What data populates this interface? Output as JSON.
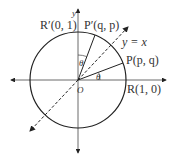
{
  "diagram": {
    "type": "unit-circle reflection",
    "axes": {
      "x_label": "x",
      "y_label": "y"
    },
    "line_label": "y = x",
    "points": [
      {
        "name": "R",
        "label": "R(1, 0)"
      },
      {
        "name": "R'",
        "label": "R′(0, 1)"
      },
      {
        "name": "P",
        "label": "P(p, q)"
      },
      {
        "name": "P'",
        "label": "P′(q, p)"
      },
      {
        "name": "O",
        "label": "O"
      }
    ],
    "angle_label": "θ",
    "colors": {
      "stroke": "#222222",
      "text": "#333333",
      "background": "#ffffff"
    }
  },
  "labels": {
    "y_axis": "y",
    "line": "y = x",
    "r_prime": "R′(0, 1)",
    "p_prime": "P′(q, p)",
    "p": "P(p, q)",
    "r": "R(1, 0)",
    "origin": "O",
    "theta1": "θ",
    "theta2": "θ"
  }
}
